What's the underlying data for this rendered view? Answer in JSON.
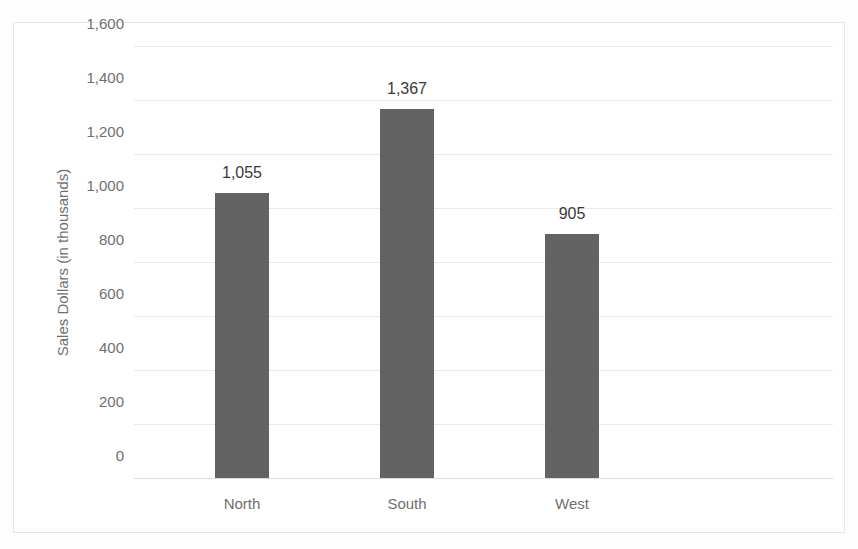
{
  "chart_data": {
    "type": "bar",
    "title": "",
    "xlabel": "",
    "ylabel": "Sales Dollars (in thousands)",
    "categories": [
      "North",
      "South",
      "West"
    ],
    "values": [
      1055,
      1367,
      905
    ],
    "value_labels": [
      "1,055",
      "1,367",
      "905"
    ],
    "ylim": [
      0,
      1600
    ],
    "ytick_values": [
      0,
      200,
      400,
      600,
      800,
      1000,
      1200,
      1400,
      1600
    ],
    "ytick_labels": [
      "0",
      "200",
      "400",
      "600",
      "800",
      "1,000",
      "1,200",
      "1,400",
      "1,600"
    ],
    "grid": true,
    "legend": false,
    "series": [
      {
        "name": "Sales Dollars",
        "values": [
          1055,
          1367,
          905
        ],
        "color": "#636363"
      }
    ]
  },
  "colors": {
    "bar_fill": "#636363",
    "gridline": "#e9e9e9",
    "axis_text": "#6f6f6f",
    "data_label_text": "#3a3a3a",
    "chart_border": "#e6e6e6",
    "plot_background": "#ffffff"
  }
}
